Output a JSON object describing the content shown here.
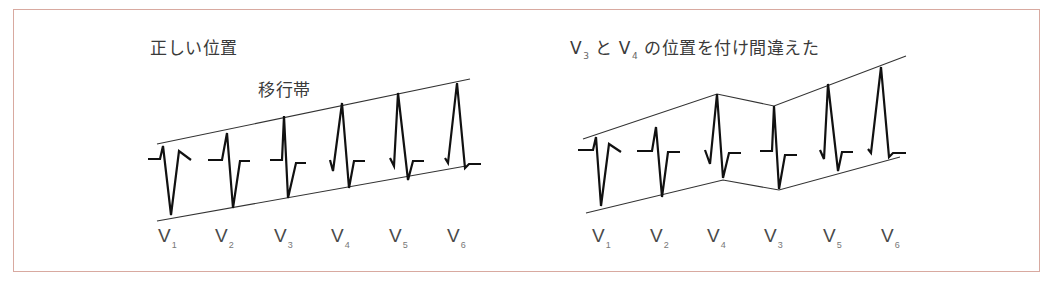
{
  "panels": {
    "left": {
      "title": "正しい位置",
      "zone_label": "移行帯",
      "leads": [
        {
          "base": "V",
          "sub": "1"
        },
        {
          "base": "V",
          "sub": "2"
        },
        {
          "base": "V",
          "sub": "3"
        },
        {
          "base": "V",
          "sub": "4"
        },
        {
          "base": "V",
          "sub": "5"
        },
        {
          "base": "V",
          "sub": "6"
        }
      ]
    },
    "right": {
      "title_parts": {
        "v3_base": "V",
        "v3_sub": "3",
        "and": "と",
        "v4_base": "V",
        "v4_sub": "4",
        "rest": "の位置を付け間違えた"
      },
      "leads": [
        {
          "base": "V",
          "sub": "1"
        },
        {
          "base": "V",
          "sub": "2"
        },
        {
          "base": "V",
          "sub": "4"
        },
        {
          "base": "V",
          "sub": "3"
        },
        {
          "base": "V",
          "sub": "5"
        },
        {
          "base": "V",
          "sub": "6"
        }
      ]
    }
  },
  "colors": {
    "frame": "#d8a9a0",
    "trace": "#111111",
    "text": "#3a3a3a"
  }
}
